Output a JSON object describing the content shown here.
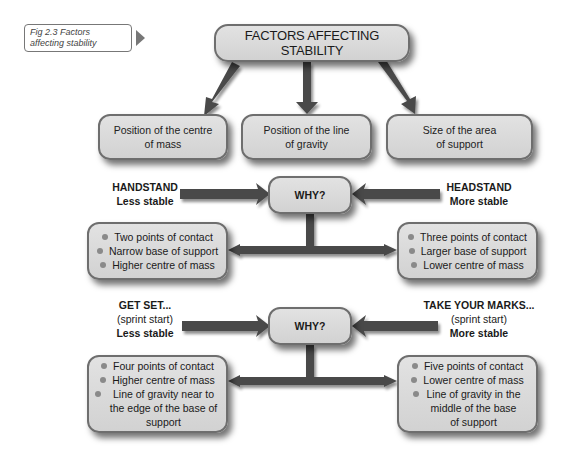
{
  "caption": {
    "text": "Fig 2.3 Factors affecting stability"
  },
  "title": "FACTORS AFFECTING STABILITY",
  "factors": [
    {
      "line1": "Position of the centre",
      "line2": "of mass"
    },
    {
      "line1": "Position of the line",
      "line2": "of gravity"
    },
    {
      "line1": "Size of the area",
      "line2": "of support"
    }
  ],
  "comparisons": [
    {
      "why": "WHY?",
      "left": {
        "name": "HANDSTAND",
        "note": "",
        "verdict": "Less stable",
        "points": [
          "Two points of contact",
          "Narrow base of support",
          "Higher centre of mass"
        ]
      },
      "right": {
        "name": "HEADSTAND",
        "note": "",
        "verdict": "More stable",
        "points": [
          "Three points of contact",
          "Larger base of support",
          "Lower centre of mass"
        ]
      }
    },
    {
      "why": "WHY?",
      "left": {
        "name": "GET SET...",
        "note": "(sprint start)",
        "verdict": "Less stable",
        "points": [
          "Four points of contact",
          "Higher centre of mass",
          "Line of gravity near to the edge of the base of support"
        ]
      },
      "right": {
        "name": "TAKE YOUR MARKS...",
        "note": "(sprint start)",
        "verdict": "More stable",
        "points": [
          "Five points of contact",
          "Lower centre of mass",
          "Line of gravity in the middle of the base of support"
        ]
      }
    }
  ],
  "colors": {
    "box_fill": "#d9d9d9",
    "box_border": "#6e6e6e",
    "arrow": "#4a4a4a"
  }
}
